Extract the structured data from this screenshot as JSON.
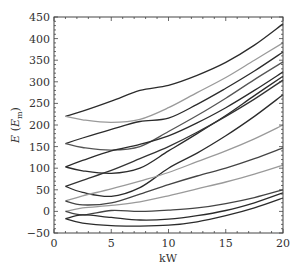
{
  "chart_data": {
    "type": "line",
    "title": "",
    "xlabel": "kW",
    "ylabel": "E (E_m)",
    "ylabel_main": "E",
    "ylabel_sub": "m",
    "xlim": [
      0,
      20
    ],
    "ylim": [
      -50,
      450
    ],
    "xticks": [
      0,
      5,
      10,
      15,
      20
    ],
    "yticks": [
      -50,
      0,
      50,
      100,
      150,
      200,
      250,
      300,
      350,
      400,
      450
    ],
    "grid": false,
    "legend": null,
    "x": [
      1,
      2.5,
      5,
      7.5,
      10,
      12.5,
      15,
      17.5,
      20
    ],
    "series": [
      {
        "name": "level-1",
        "color": "#2b2b2b",
        "values": [
          220,
          232,
          255,
          280,
          292,
          315,
          345,
          385,
          434
        ]
      },
      {
        "name": "level-2",
        "color": "#9a9a9a",
        "values": [
          220,
          212,
          206,
          213,
          240,
          275,
          310,
          350,
          390
        ]
      },
      {
        "name": "level-3",
        "color": "#2b2b2b",
        "values": [
          157,
          170,
          190,
          208,
          216,
          248,
          285,
          325,
          369
        ]
      },
      {
        "name": "level-4",
        "color": "#555555",
        "values": [
          157,
          148,
          142,
          150,
          185,
          222,
          262,
          305,
          346
        ]
      },
      {
        "name": "level-5",
        "color": "#2b2b2b",
        "values": [
          103,
          118,
          140,
          155,
          175,
          205,
          240,
          280,
          323
        ]
      },
      {
        "name": "level-6",
        "color": "#2b2b2b",
        "values": [
          103,
          94,
          88,
          100,
          140,
          180,
          222,
          268,
          313
        ]
      },
      {
        "name": "level-7",
        "color": "#333333",
        "values": [
          58,
          72,
          95,
          122,
          150,
          183,
          220,
          260,
          304
        ]
      },
      {
        "name": "level-8",
        "color": "#2b2b2b",
        "values": [
          58,
          44,
          35,
          55,
          100,
          135,
          175,
          220,
          270
        ]
      },
      {
        "name": "level-9",
        "color": "#9a9a9a",
        "values": [
          24,
          36,
          52,
          70,
          90,
          115,
          140,
          168,
          200
        ]
      },
      {
        "name": "level-10",
        "color": "#444444",
        "values": [
          24,
          15,
          20,
          40,
          62,
          82,
          100,
          122,
          147
        ]
      },
      {
        "name": "level-11",
        "color": "#9a9a9a",
        "values": [
          0,
          8,
          14,
          22,
          36,
          52,
          68,
          86,
          107
        ]
      },
      {
        "name": "level-12",
        "color": "#444444",
        "values": [
          0,
          -8,
          2,
          0,
          3,
          8,
          18,
          32,
          50
        ]
      },
      {
        "name": "level-13",
        "color": "#2b2b2b",
        "values": [
          -17,
          -8,
          -14,
          -20,
          -18,
          -10,
          2,
          20,
          43
        ]
      },
      {
        "name": "level-14",
        "color": "#2b2b2b",
        "values": [
          -17,
          -27,
          -33,
          -34,
          -32,
          -24,
          -10,
          8,
          31
        ]
      }
    ]
  }
}
